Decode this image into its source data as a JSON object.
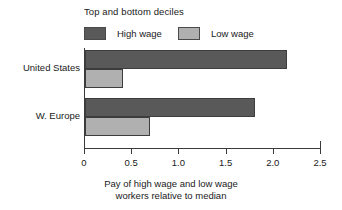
{
  "chart_data": {
    "type": "bar",
    "orientation": "horizontal",
    "title": "",
    "legend_title": "Top and bottom deciles",
    "legend_position": "top-left",
    "categories": [
      "United States",
      "W. Europe"
    ],
    "series": [
      {
        "name": "High wage",
        "values": [
          2.14,
          1.8
        ],
        "color": "#595959"
      },
      {
        "name": "Low wage",
        "values": [
          0.4,
          0.69
        ],
        "color": "#b0b0b0"
      }
    ],
    "xlabel_lines": [
      "Pay of high wage and low wage",
      "workers relative to median"
    ],
    "ylabel": "",
    "xlim": [
      0,
      2.5
    ],
    "xticks": [
      0,
      0.5,
      1.0,
      1.5,
      2.0,
      2.5
    ],
    "xtick_labels": [
      "0",
      "0.5",
      "1.0",
      "1.5",
      "2.0",
      "2.5"
    ],
    "grid": false
  },
  "colors": {
    "high_wage": "#595959",
    "low_wage": "#b0b0b0",
    "axis": "#3a3a3a",
    "background": "#ffffff",
    "text": "#1a1a1a"
  }
}
